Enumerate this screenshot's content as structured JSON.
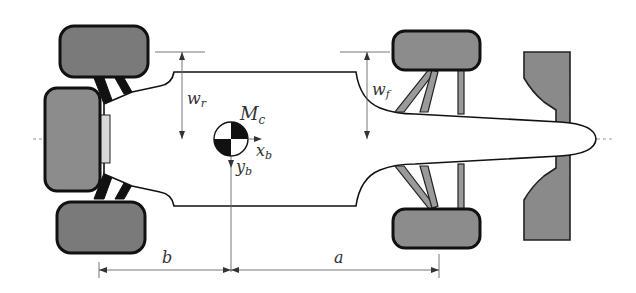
{
  "diagram": {
    "labels": {
      "rear_track_half_width": "w",
      "rear_track_sub": "r",
      "front_track_half_width": "w",
      "front_track_sub": "f",
      "center_of_mass": "M",
      "center_of_mass_sub": "c",
      "body_x_axis": "x",
      "body_x_axis_sub": "b",
      "body_y_axis": "y",
      "body_y_axis_sub": "b",
      "rear_distance": "b",
      "front_distance": "a"
    },
    "colors": {
      "tire_fill": "#8c8c8c",
      "outline": "#111111",
      "centerline": "#9a9a9a",
      "dimension": "#666666"
    }
  }
}
